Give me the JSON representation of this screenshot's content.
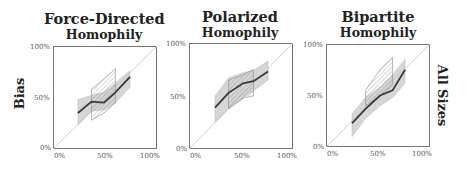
{
  "figure": {
    "row_label_left": "Bias",
    "row_label_right": "All Sizes",
    "x_ticks": [
      "0%",
      "50%",
      "100%"
    ],
    "y_ticks": [
      "0%",
      "50%",
      "100%"
    ]
  },
  "panels": [
    {
      "title_line1": "Force-Directed",
      "title_line2": "Homophily"
    },
    {
      "title_line1": "Polarized",
      "title_line2": "Homophily"
    },
    {
      "title_line1": "Bipartite",
      "title_line2": "Homophily"
    }
  ],
  "colors": {
    "line": "#3a3a3a",
    "band_fill": "#c8c8c8",
    "hatch": "#8a8a8a",
    "diagonal": "#d0d0d0",
    "frame": "#777777"
  },
  "chart_data": [
    {
      "type": "line",
      "title": "Force-Directed Homophily",
      "xlabel": "",
      "ylabel": "Bias",
      "xlim": [
        0,
        100
      ],
      "ylim": [
        0,
        100
      ],
      "x_ticks": [
        "0%",
        "50%",
        "100%"
      ],
      "y_ticks": [
        "0%",
        "50%",
        "100%"
      ],
      "reference_line": "y = x (diagonal)",
      "series": [
        {
          "name": "mean",
          "x": [
            24,
            37,
            49,
            60,
            74
          ],
          "y": [
            35,
            46,
            45,
            55,
            70
          ]
        }
      ],
      "bands": [
        {
          "name": "shaded range",
          "x": [
            24,
            37,
            49,
            60,
            74
          ],
          "lower": [
            23,
            37,
            38,
            45,
            60
          ],
          "upper": [
            48,
            52,
            55,
            64,
            76
          ]
        },
        {
          "name": "hatched range",
          "x": [
            37,
            49,
            60
          ],
          "lower": [
            28,
            35,
            45
          ],
          "upper": [
            58,
            68,
            78
          ]
        }
      ],
      "grid": false
    },
    {
      "type": "line",
      "title": "Polarized Homophily",
      "xlabel": "",
      "ylabel": "",
      "xlim": [
        0,
        100
      ],
      "ylim": [
        0,
        100
      ],
      "x_ticks": [
        "0%",
        "50%",
        "100%"
      ],
      "y_ticks": [
        "0%",
        "50%",
        "100%"
      ],
      "reference_line": "y = x (diagonal)",
      "series": [
        {
          "name": "mean",
          "x": [
            25,
            38,
            52,
            62,
            76
          ],
          "y": [
            39,
            53,
            62,
            64,
            73
          ]
        }
      ],
      "bands": [
        {
          "name": "shaded range",
          "x": [
            25,
            38,
            52,
            62,
            76
          ],
          "lower": [
            25,
            38,
            48,
            55,
            65
          ],
          "upper": [
            50,
            67,
            72,
            74,
            83
          ]
        },
        {
          "name": "hatched range",
          "x": [
            38,
            52,
            62
          ],
          "lower": [
            38,
            48,
            50
          ],
          "upper": [
            65,
            70,
            75
          ]
        }
      ],
      "grid": false
    },
    {
      "type": "line",
      "title": "Bipartite Homophily",
      "xlabel": "",
      "ylabel": "All Sizes",
      "xlim": [
        0,
        100
      ],
      "ylim": [
        0,
        100
      ],
      "x_ticks": [
        "0%",
        "50%",
        "100%"
      ],
      "y_ticks": [
        "0%",
        "50%",
        "100%"
      ],
      "reference_line": "y = x (diagonal)",
      "series": [
        {
          "name": "mean",
          "x": [
            25,
            38,
            52,
            64,
            76
          ],
          "y": [
            23,
            37,
            50,
            55,
            75
          ]
        }
      ],
      "bands": [
        {
          "name": "shaded range",
          "x": [
            25,
            38,
            52,
            64,
            76
          ],
          "lower": [
            10,
            28,
            40,
            48,
            62
          ],
          "upper": [
            32,
            48,
            58,
            70,
            85
          ]
        },
        {
          "name": "hatched range",
          "x": [
            38,
            52,
            64
          ],
          "lower": [
            40,
            50,
            60
          ],
          "upper": [
            55,
            75,
            87
          ]
        }
      ],
      "grid": false
    }
  ]
}
